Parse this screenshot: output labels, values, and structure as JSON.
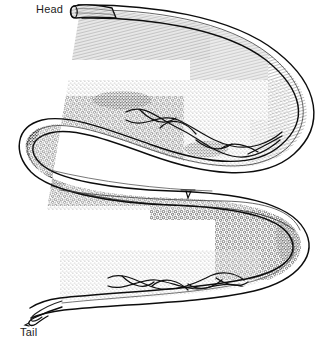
{
  "figure": {
    "kind": "scientific-line-drawing",
    "orientation": "s-curve-lateral-view",
    "background_color": "#ffffff",
    "ink_color": "#111111",
    "render_style": "pen-and-ink stipple and hatching, black on white"
  },
  "labels": {
    "head": "Head",
    "tail": "Tail"
  },
  "anatomy": {
    "parts": [
      {
        "name": "head",
        "label": "Head",
        "description": "blunt rounded anterior tip with fine longitudinal striations",
        "position": "upper-left"
      },
      {
        "name": "anterior-body",
        "label": "",
        "description": "slender esophageal region sweeping right and curving down",
        "position": "upper"
      },
      {
        "name": "cuticle-annulations",
        "label": "",
        "description": "fine transverse ring markings along the outer right curve",
        "position": "right-loop"
      },
      {
        "name": "gonad-oocytes",
        "label": "",
        "description": "dense granular egg-filled ovary occupying the mid body",
        "position": "mid-left-loop"
      },
      {
        "name": "reproductive-tract",
        "label": "",
        "description": "braided coiled uterine tubes crossing the mid and posterior body",
        "position": "mid-body and pre-tail"
      },
      {
        "name": "vulva",
        "label": "",
        "description": "small ventral notch marking the genital pore near mid body",
        "position": "center"
      },
      {
        "name": "tail",
        "label": "Tail",
        "description": "long tapering posterior narrowing to a fine point",
        "position": "lower-left"
      }
    ]
  },
  "colors": {
    "ink": "#111111",
    "ink_soft": "#3a3a3a",
    "ink_faint": "#777777",
    "paper": "#ffffff",
    "label_text": "#1d1d1d"
  }
}
